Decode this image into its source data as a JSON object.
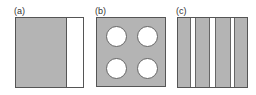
{
  "panels": [
    {
      "label": "(a)",
      "description": "square with gray left portion and white strip at right"
    },
    {
      "label": "(b)",
      "description": "gray square with four white circular holes in a 2x2 grid"
    },
    {
      "label": "(c)",
      "description": "square with alternating vertical gray and white stripes"
    }
  ],
  "colors": {
    "fill": "#b4b4b4",
    "outline": "#555555",
    "background": "#ffffff"
  }
}
